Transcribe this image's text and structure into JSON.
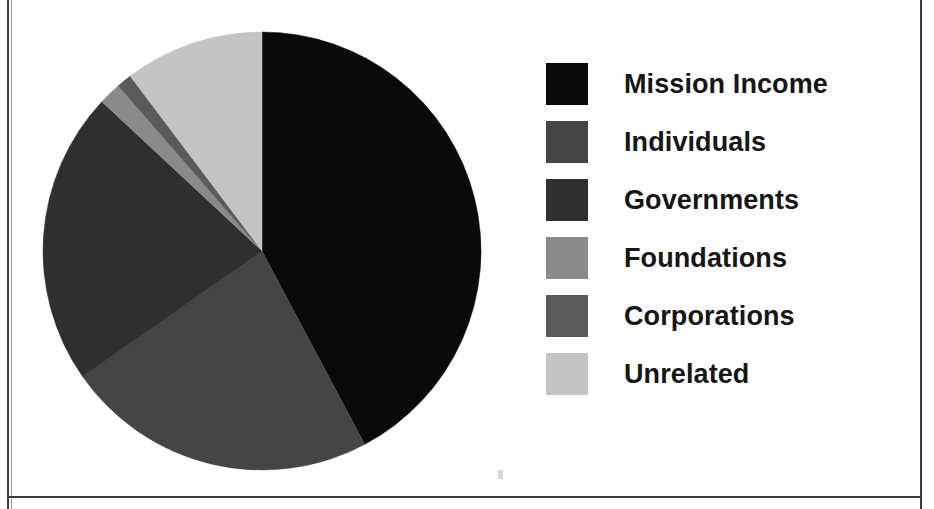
{
  "chart_data": {
    "type": "pie",
    "title": "",
    "subtitle": "",
    "xlabel": "",
    "ylabel": "",
    "grid": false,
    "legend_position": "right",
    "start_angle_deg": 0,
    "direction": "clockwise",
    "center": {
      "x": 262,
      "y": 251
    },
    "radius": 220,
    "categories": [
      "Mission Income",
      "Individuals",
      "Governments",
      "Foundations",
      "Corporations",
      "Unrelated"
    ],
    "values": [
      42.2,
      23.1,
      21.7,
      1.6,
      1.2,
      10.3
    ],
    "angles_deg": [
      152.0,
      83.0,
      78.0,
      6.0,
      4.0,
      37.0
    ],
    "colors": [
      "#0a0a0a",
      "#454545",
      "#2f2f2f",
      "#8a8a8a",
      "#5a5a5a",
      "#c4c4c4"
    ],
    "slices": [
      {
        "label": "Mission Income",
        "value": 42.2,
        "angle_deg": 152.0,
        "start_deg": 0.0,
        "end_deg": 152.0,
        "color": "#0a0a0a"
      },
      {
        "label": "Individuals",
        "value": 23.1,
        "angle_deg": 83.0,
        "start_deg": 152.0,
        "end_deg": 235.0,
        "color": "#454545"
      },
      {
        "label": "Governments",
        "value": 21.7,
        "angle_deg": 78.0,
        "start_deg": 235.0,
        "end_deg": 313.0,
        "color": "#2f2f2f"
      },
      {
        "label": "Foundations",
        "value": 1.6,
        "angle_deg": 6.0,
        "start_deg": 313.0,
        "end_deg": 319.0,
        "color": "#8a8a8a"
      },
      {
        "label": "Corporations",
        "value": 1.2,
        "angle_deg": 4.0,
        "start_deg": 319.0,
        "end_deg": 323.0,
        "color": "#5a5a5a"
      },
      {
        "label": "Unrelated",
        "value": 10.3,
        "angle_deg": 37.0,
        "start_deg": 323.0,
        "end_deg": 360.0,
        "color": "#c4c4c4"
      }
    ]
  },
  "legend": {
    "items": [
      {
        "label": "Mission Income",
        "color": "#0a0a0a"
      },
      {
        "label": "Individuals",
        "color": "#454545"
      },
      {
        "label": "Governments",
        "color": "#2f2f2f"
      },
      {
        "label": "Foundations",
        "color": "#8a8a8a"
      },
      {
        "label": "Corporations",
        "color": "#5a5a5a"
      },
      {
        "label": "Unrelated",
        "color": "#c4c4c4"
      }
    ]
  },
  "page": {
    "background_color": "#ffffff",
    "border_color": "#3d3d3d"
  }
}
